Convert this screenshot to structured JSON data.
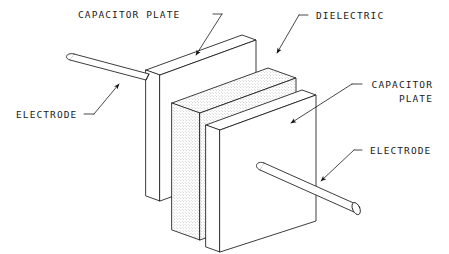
{
  "diagram": {
    "title_text": "",
    "background_color": "#ffffff",
    "line_color": "#1a1a1a",
    "dielectric_fill": "#f2f2f2",
    "plate_fill": "#ffffff",
    "labels": {
      "capacitor_plate_top": "CAPACITOR PLATE",
      "dielectric": "DIELECTRIC",
      "capacitor_plate_right_line1": "CAPACITOR",
      "capacitor_plate_right_line2": "PLATE",
      "electrode_left": "ELECTRODE",
      "electrode_right": "ELECTRODE"
    },
    "parts": {
      "rear_plate": "capacitor-plate-rear",
      "dielectric_block": "dielectric-block",
      "front_plate": "capacitor-plate-front",
      "electrode_rod_upper_left": "electrode-rod-upper-left",
      "electrode_rod_lower_right": "electrode-rod-lower-right"
    },
    "leaders": [
      "leader-capacitor-plate-top",
      "leader-dielectric",
      "leader-capacitor-plate-right",
      "leader-electrode-left",
      "leader-electrode-right"
    ]
  }
}
